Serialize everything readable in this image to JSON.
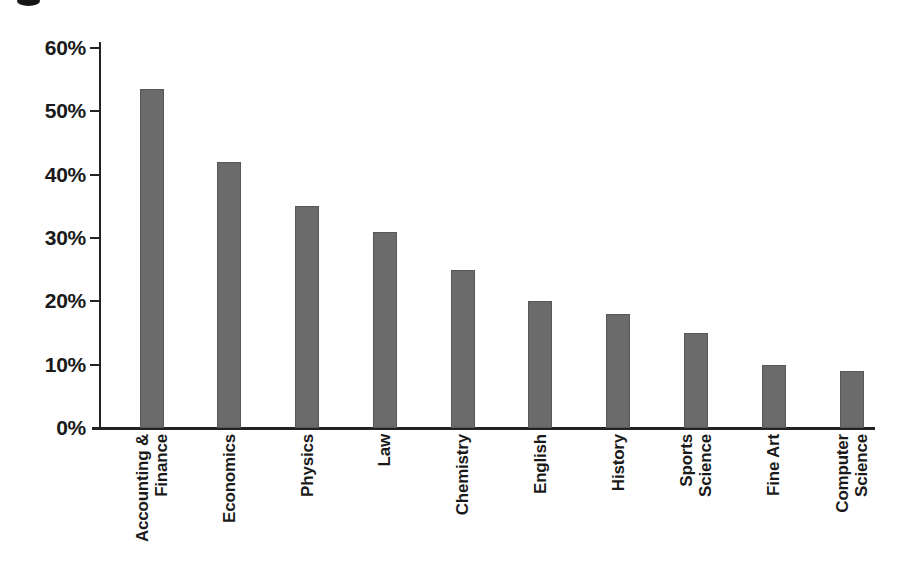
{
  "figure": {
    "background_color": "#ffffff",
    "text_color": "#1a1a1a",
    "axis_color": "#232323"
  },
  "chart_data": {
    "type": "bar",
    "title": "",
    "xlabel": "",
    "ylabel": "",
    "categories": [
      "Accounting &\nFinance",
      "Economics",
      "Physics",
      "Law",
      "Chemistry",
      "English",
      "History",
      "Sports\nScience",
      "Fine Art",
      "Computer\nScience"
    ],
    "values": [
      53.5,
      42,
      35,
      31,
      25,
      20,
      18,
      15,
      10,
      9
    ],
    "unit": "%",
    "ylim": [
      0,
      60
    ],
    "ytick_step": 10,
    "ytick_labels": [
      "0%",
      "10%",
      "20%",
      "30%",
      "40%",
      "50%",
      "60%"
    ],
    "bar_color": "#6b6b6b",
    "bar_edge_color": "#575757",
    "grid": false,
    "legend": null,
    "x_label_rotation_deg": -90
  }
}
